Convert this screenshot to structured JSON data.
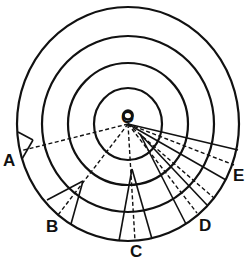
{
  "diagram": {
    "title": "",
    "center_label": "O",
    "point_labels": [
      "A",
      "B",
      "C",
      "D",
      "E"
    ],
    "rings": 4,
    "colors": {
      "ink": "#111111",
      "background": "#ffffff"
    }
  }
}
